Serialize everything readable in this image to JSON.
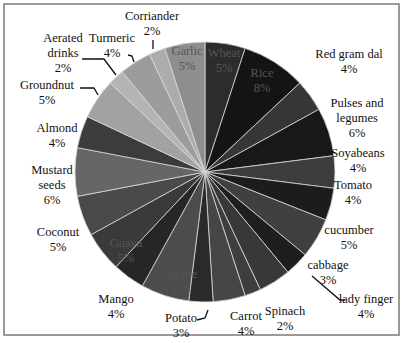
{
  "chart_data": {
    "type": "pie",
    "title": "",
    "start_angle_deg": 90,
    "direction": "clockwise",
    "center": [
      205,
      172
    ],
    "radius": 130,
    "slices": [
      {
        "label": "Wheat",
        "value": 5,
        "pct": "5%",
        "color": "#2c2c2c"
      },
      {
        "label": "Rice",
        "value": 8,
        "pct": "8%",
        "color": "#141414"
      },
      {
        "label": "Red gram dal",
        "value": 4,
        "pct": "4%",
        "color": "#363636"
      },
      {
        "label": "Pulses and legumes",
        "value": 6,
        "pct": "6%",
        "color": "#181818"
      },
      {
        "label": "Soyabeans",
        "value": 4,
        "pct": "4%",
        "color": "#3c3c3c"
      },
      {
        "label": "Tomato",
        "value": 4,
        "pct": "4%",
        "color": "#1c1c1c"
      },
      {
        "label": "cucumber",
        "value": 5,
        "pct": "5%",
        "color": "#404040"
      },
      {
        "label": "cabbage",
        "value": 3,
        "pct": "3%",
        "color": "#1e1e1e"
      },
      {
        "label": "lady finger",
        "value": 4,
        "pct": "4%",
        "color": "#383838"
      },
      {
        "label": "Spinach",
        "value": 2,
        "pct": "2%",
        "color": "#3e3e3e"
      },
      {
        "label": "Carrot",
        "value": 4,
        "pct": "4%",
        "color": "#464646"
      },
      {
        "label": "Potato",
        "value": 3,
        "pct": "3%",
        "color": "#2a2a2a"
      },
      {
        "label": "Apple",
        "value": 6,
        "pct": "6%",
        "color": "#4c4c4c"
      },
      {
        "label": "Mango",
        "value": 4,
        "pct": "4%",
        "color": "#262626"
      },
      {
        "label": "Guava",
        "value": 5,
        "pct": "5%",
        "color": "#3a3a3a"
      },
      {
        "label": "Coconut",
        "value": 5,
        "pct": "5%",
        "color": "#4a4a4a"
      },
      {
        "label": "Mustard seeds",
        "value": 6,
        "pct": "6%",
        "color": "#666666"
      },
      {
        "label": "Almond",
        "value": 4,
        "pct": "4%",
        "color": "#3c3c3c"
      },
      {
        "label": "Groundnut",
        "value": 5,
        "pct": "5%",
        "color": "#a2a2a2"
      },
      {
        "label": "Aerated drinks",
        "value": 2,
        "pct": "2%",
        "color": "#b4b4b4"
      },
      {
        "label": "Turmeric",
        "value": 4,
        "pct": "4%",
        "color": "#9c9c9c"
      },
      {
        "label": "Corriander",
        "value": 2,
        "pct": "2%",
        "color": "#acacac"
      },
      {
        "label": "Garlic",
        "value": 5,
        "pct": "5%",
        "color": "#8e8e8e"
      }
    ],
    "legend": "none",
    "data_labels": "category name and percentage"
  },
  "labels": [
    {
      "name": "Wheat",
      "pct": "5%",
      "x": 224,
      "y": 46,
      "inside": true
    },
    {
      "name": "Rice",
      "pct": "8%",
      "x": 262,
      "y": 66,
      "inside": true
    },
    {
      "name": "Red gram dal",
      "pct": "4%",
      "x": 349,
      "y": 47,
      "inside": false
    },
    {
      "name": "Pulses and",
      "name2": "legumes",
      "pct": "6%",
      "x": 357,
      "y": 96,
      "inside": false
    },
    {
      "name": "Soyabeans",
      "pct": "4%",
      "x": 358,
      "y": 146,
      "inside": false
    },
    {
      "name": "Tomato",
      "pct": "4%",
      "x": 353,
      "y": 178,
      "inside": false
    },
    {
      "name": "cucumber",
      "pct": "5%",
      "x": 349,
      "y": 223,
      "inside": false
    },
    {
      "name": "cabbage",
      "pct": "3%",
      "x": 328,
      "y": 258,
      "inside": false
    },
    {
      "name": "lady finger",
      "pct": "4%",
      "x": 366,
      "y": 292,
      "inside": false
    },
    {
      "name": "Spinach",
      "pct": "2%",
      "x": 285,
      "y": 304,
      "inside": false
    },
    {
      "name": "Carrot",
      "pct": "4%",
      "x": 246,
      "y": 309,
      "inside": false
    },
    {
      "name": "Potato",
      "pct": "3%",
      "x": 181,
      "y": 311,
      "inside": false
    },
    {
      "name": "Apple",
      "pct": "6%",
      "x": 182,
      "y": 267,
      "inside": true
    },
    {
      "name": "Mango",
      "pct": "4%",
      "x": 116,
      "y": 292,
      "inside": false
    },
    {
      "name": "Guava",
      "pct": "5%",
      "x": 126,
      "y": 236,
      "inside": true
    },
    {
      "name": "Coconut",
      "pct": "5%",
      "x": 58,
      "y": 225,
      "inside": false
    },
    {
      "name": "Mustard",
      "name2": "seeds",
      "pct": "6%",
      "x": 52,
      "y": 163,
      "inside": false
    },
    {
      "name": "Almond",
      "pct": "4%",
      "x": 57,
      "y": 121,
      "inside": false
    },
    {
      "name": "Groundnut",
      "pct": "5%",
      "x": 47,
      "y": 78,
      "inside": false
    },
    {
      "name": "Aerated",
      "name2": "drinks",
      "pct": "2%",
      "x": 63,
      "y": 31,
      "inside": false
    },
    {
      "name": "Turmeric",
      "pct": "4%",
      "x": 112,
      "y": 31,
      "inside": false
    },
    {
      "name": "Corriander",
      "pct": "2%",
      "x": 152,
      "y": 9,
      "inside": false
    },
    {
      "name": "Garlic",
      "pct": "5%",
      "x": 187,
      "y": 44,
      "inside": true
    }
  ],
  "leader_lines": [
    {
      "for": "Aerated drinks",
      "points": [
        [
          82,
          59
        ],
        [
          104,
          59
        ],
        [
          116,
          75
        ]
      ]
    },
    {
      "for": "Turmeric",
      "points": [
        [
          128,
          55
        ],
        [
          132,
          56
        ],
        [
          134,
          62
        ]
      ]
    },
    {
      "for": "Corriander",
      "points": [
        [
          153,
          40
        ],
        [
          153,
          49
        ]
      ]
    },
    {
      "for": "Groundnut",
      "points": [
        [
          80,
          88
        ],
        [
          94,
          88
        ],
        [
          98,
          95
        ]
      ]
    },
    {
      "for": "lady finger",
      "points": [
        [
          345,
          300
        ],
        [
          340,
          300
        ],
        [
          312,
          276
        ]
      ]
    },
    {
      "for": "Potato",
      "points": [
        [
          197,
          320
        ],
        [
          205,
          318
        ],
        [
          208,
          310
        ]
      ]
    }
  ]
}
